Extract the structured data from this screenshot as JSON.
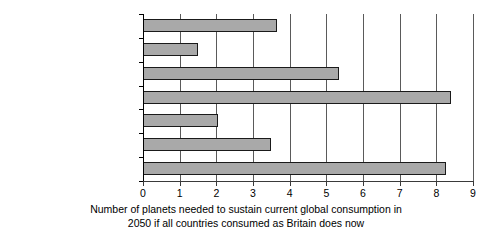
{
  "chart_data": {
    "type": "bar",
    "orientation": "horizontal",
    "title": "",
    "subtitle": "",
    "categories": [
      "Wood",
      "Land",
      "Steel",
      "Aluminium",
      "Construction aggregates",
      "Cement",
      "Energy (CO2)"
    ],
    "category_labels_display": [
      "Wood",
      "Land",
      "Steel",
      "Aluminium",
      "Construction aggregates",
      "Cement",
      "Energy (CO₂)"
    ],
    "values": [
      3.65,
      1.5,
      5.35,
      8.4,
      2.05,
      3.5,
      8.25
    ],
    "xlabel": "Number of planets needed to sustain current global consumption in 2050 if all countries consumed as Britain does now",
    "ylabel": "",
    "xlim": [
      0,
      9
    ],
    "xticks": [
      0,
      1,
      2,
      3,
      4,
      5,
      6,
      7,
      8,
      9
    ],
    "xtick_labels": [
      "0",
      "1",
      "2",
      "3",
      "4",
      "5",
      "6",
      "7",
      "8",
      "9"
    ],
    "grid": "vertical",
    "legend": "none",
    "bar_fill_color": "#a9a9a9",
    "bar_edge_color": "#1a1a1a",
    "gridline_color": "#5a5a5a",
    "axis_color": "#000000"
  },
  "caption": {
    "line1": "Number of planets needed to sustain current global consumption in",
    "line2": "2050 if all countries consumed as Britain does now"
  },
  "energy_label": {
    "base": "Energy (CO",
    "sub": "2",
    "tail": ")"
  }
}
